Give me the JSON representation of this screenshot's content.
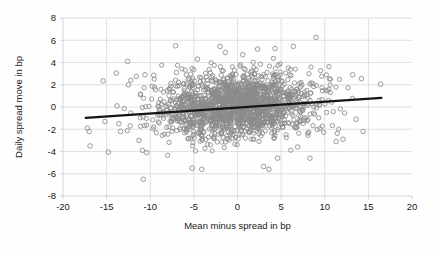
{
  "chart_data": {
    "type": "scatter",
    "title": "",
    "xlabel": "Mean minus spread in bp",
    "ylabel": "Daily spread move in bp",
    "xlim": [
      -20,
      20
    ],
    "ylim": [
      -8,
      8
    ],
    "xticks": [
      -20,
      -15,
      -10,
      -5,
      0,
      5,
      10,
      15,
      20
    ],
    "yticks": [
      -8,
      -6,
      -4,
      -2,
      0,
      2,
      4,
      6,
      8
    ],
    "xtick_labels": [
      "-20",
      "-15",
      "-10",
      "-5",
      "0",
      "5",
      "10",
      "15",
      "20"
    ],
    "ytick_labels": [
      "-8",
      "-6",
      "-4",
      "-2",
      "0",
      "2",
      "4",
      "6",
      "8"
    ],
    "grid": true,
    "legend": "none",
    "marker_style": "open-circle",
    "marker_color": "#8a8a8a",
    "n_points": 1700,
    "series": [
      {
        "name": "Daily spread move vs mean minus spread",
        "marker": "open-circle",
        "correlation": 0.13,
        "cloud_center": [
          0.0,
          0.1
        ],
        "cloud_sd_x": 4.2,
        "cloud_sd_y": 1.45,
        "x_observed_range": [
          -17.3,
          16.5
        ],
        "y_observed_range": [
          -6.5,
          6.3
        ]
      }
    ],
    "trendline": {
      "type": "linear-fit",
      "color": "#141414",
      "x_start": -17.4,
      "y_start": -0.98,
      "x_end": 16.5,
      "y_end": 0.82,
      "slope": 0.053,
      "intercept": -0.06
    },
    "notable_points": [
      {
        "x": -17.2,
        "y": -1.9
      },
      {
        "x": -17.0,
        "y": -2.2
      },
      {
        "x": -16.9,
        "y": -3.5
      },
      {
        "x": -15.4,
        "y": 2.35
      },
      {
        "x": -15.2,
        "y": -1.3
      },
      {
        "x": -14.8,
        "y": -4.05
      },
      {
        "x": -13.9,
        "y": 3.05
      },
      {
        "x": -13.8,
        "y": 0.1
      },
      {
        "x": -13.6,
        "y": -1.5
      },
      {
        "x": -13.4,
        "y": -2.2
      },
      {
        "x": -12.6,
        "y": 4.1
      },
      {
        "x": -12.5,
        "y": 2.0
      },
      {
        "x": -12.3,
        "y": -1.7
      },
      {
        "x": -11.6,
        "y": 2.75
      },
      {
        "x": -11.3,
        "y": -3.0
      },
      {
        "x": -10.9,
        "y": -3.9
      },
      {
        "x": -10.8,
        "y": -6.5
      },
      {
        "x": -10.6,
        "y": 2.9
      },
      {
        "x": -10.4,
        "y": -4.1
      },
      {
        "x": -9.6,
        "y": 2.85
      },
      {
        "x": -9.4,
        "y": 1.55
      },
      {
        "x": -7.1,
        "y": 5.5
      },
      {
        "x": -7.0,
        "y": 3.1
      },
      {
        "x": -5.2,
        "y": -5.5
      },
      {
        "x": -4.6,
        "y": 4.3
      },
      {
        "x": -4.1,
        "y": -5.6
      },
      {
        "x": -2.0,
        "y": 5.45
      },
      {
        "x": -1.4,
        "y": 4.9
      },
      {
        "x": 0.6,
        "y": 4.7
      },
      {
        "x": 2.3,
        "y": 5.2
      },
      {
        "x": 3.0,
        "y": -5.35
      },
      {
        "x": 3.6,
        "y": -5.6
      },
      {
        "x": 4.3,
        "y": 5.25
      },
      {
        "x": 4.6,
        "y": -4.6
      },
      {
        "x": 6.4,
        "y": 5.45
      },
      {
        "x": 6.9,
        "y": -3.6
      },
      {
        "x": 8.3,
        "y": -4.6
      },
      {
        "x": 9.0,
        "y": 6.25
      },
      {
        "x": 11.3,
        "y": -3.1
      },
      {
        "x": 12.1,
        "y": -2.9
      },
      {
        "x": 13.2,
        "y": 2.9
      },
      {
        "x": 13.6,
        "y": -1.1
      },
      {
        "x": 14.2,
        "y": 2.55
      },
      {
        "x": 14.4,
        "y": -2.2
      },
      {
        "x": 16.4,
        "y": 2.05
      }
    ]
  }
}
